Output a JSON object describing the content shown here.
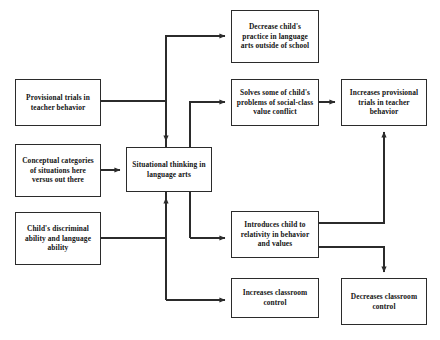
{
  "diagram": {
    "line_color": "#2b2b2b",
    "text_color": "#141414",
    "background_color": "#ffffff",
    "nodes": {
      "decrease_practice": "Decrease child's practice in language arts outside of school",
      "provisional_trials": "Provisional trials in teacher behavior",
      "solves_problems": "Solves some of child's problems of social-class value conflict",
      "increases_trials": "Increases provisional trials in teacher behavior",
      "conceptual_categories": "Conceptual categories of situations here versus out there",
      "situational_thinking": "Situational thinking in language arts",
      "childs_ability": "Child's discriminal ability and language ability",
      "introduces_child": "Introduces child to relativity in behavior and values",
      "increases_control": "Increases classroom control",
      "decreases_control": "Decreases classroom control"
    },
    "edges": [
      {
        "from": "provisional_trials",
        "to": "situational_thinking"
      },
      {
        "from": "conceptual_categories",
        "to": "situational_thinking"
      },
      {
        "from": "childs_ability",
        "to": "situational_thinking"
      },
      {
        "from": "situational_thinking",
        "to": "decrease_practice"
      },
      {
        "from": "situational_thinking",
        "to": "solves_problems"
      },
      {
        "from": "situational_thinking",
        "to": "introduces_child"
      },
      {
        "from": "situational_thinking",
        "to": "increases_control"
      },
      {
        "from": "solves_problems",
        "to": "increases_trials"
      },
      {
        "from": "introduces_child",
        "to": "increases_trials"
      },
      {
        "from": "introduces_child",
        "to": "decreases_control"
      }
    ]
  }
}
